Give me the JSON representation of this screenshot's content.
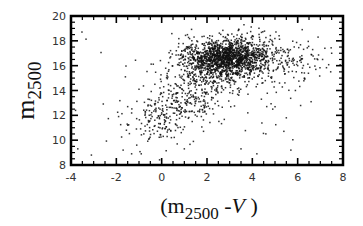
{
  "chart_data": {
    "type": "scatter",
    "title": "",
    "xlabel": "(m2500 - V)",
    "xlabel_parts": {
      "open": "(m",
      "sub": "2500",
      "mid": " -",
      "italic": "V",
      "close": " )"
    },
    "ylabel": "m2500",
    "ylabel_parts": {
      "main": "m",
      "sub": "2500"
    },
    "xlim": [
      -4,
      8
    ],
    "ylim": [
      8,
      20
    ],
    "xticks": [
      -4,
      -2,
      0,
      2,
      4,
      6,
      8
    ],
    "xtick_labels": [
      "-4",
      "-2",
      "0",
      "2",
      "4",
      "6",
      "8"
    ],
    "yticks": [
      8,
      10,
      12,
      14,
      16,
      18,
      20
    ],
    "ytick_labels": [
      "8",
      "10",
      "12",
      "14",
      "16",
      "18",
      "20"
    ],
    "x_minor_step": 0.5,
    "y_minor_step": 0.5,
    "grid": false,
    "legend": "none",
    "marker_color": "#111111",
    "approx_point_count": 2300,
    "clusters": [
      {
        "name": "dense-core",
        "count": 1500,
        "center": [
          2.8,
          16.6
        ],
        "sd": [
          0.9,
          0.75
        ],
        "rotation_deg": 8
      },
      {
        "name": "diagonal-tail",
        "count": 420,
        "from": [
          -1.0,
          10.0
        ],
        "to": [
          2.3,
          15.2
        ],
        "spread": [
          0.7,
          0.8
        ]
      },
      {
        "name": "red-plume",
        "count": 230,
        "center": [
          4.8,
          16.4
        ],
        "sd": [
          1.1,
          0.9
        ],
        "rotation_deg": 0
      },
      {
        "name": "halo",
        "count": 150,
        "center": [
          2.0,
          14.5
        ],
        "sd": [
          2.2,
          2.3
        ],
        "rotation_deg": 30
      }
    ],
    "outliers": [
      [
        -3.7,
        9.3
      ],
      [
        -3.1,
        8.8
      ],
      [
        -3.8,
        12.4
      ],
      [
        -1.7,
        9.2
      ],
      [
        -1.1,
        9.6
      ],
      [
        -0.9,
        8.9
      ],
      [
        -1.9,
        11.9
      ],
      [
        -1.5,
        12.7
      ],
      [
        -1.6,
        15.1
      ],
      [
        -1.0,
        14.1
      ],
      [
        0.6,
        15.1
      ],
      [
        -0.3,
        14.5
      ],
      [
        -0.6,
        13.3
      ],
      [
        1.0,
        9.3
      ],
      [
        1.4,
        9.9
      ],
      [
        3.5,
        9.3
      ],
      [
        4.2,
        8.9
      ],
      [
        5.7,
        9.2
      ],
      [
        5.6,
        15.5
      ],
      [
        5.2,
        14.6
      ],
      [
        6.3,
        15.0
      ],
      [
        6.6,
        16.9
      ],
      [
        7.1,
        16.5
      ],
      [
        7.2,
        17.4
      ],
      [
        6.9,
        18.3
      ],
      [
        6.2,
        18.9
      ],
      [
        6.0,
        19.6
      ],
      [
        7.5,
        17.0
      ],
      [
        5.9,
        14.0
      ],
      [
        6.8,
        15.7
      ],
      [
        4.9,
        12.5
      ],
      [
        5.5,
        11.8
      ],
      [
        3.8,
        12.2
      ],
      [
        4.4,
        13.3
      ],
      [
        6.0,
        16.0
      ]
    ]
  }
}
